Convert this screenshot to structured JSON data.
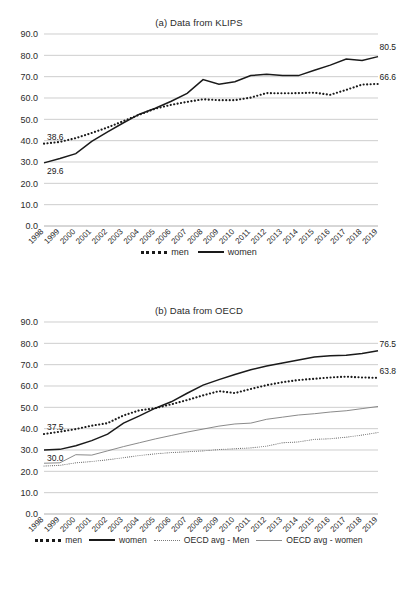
{
  "figure": {
    "top_fragment": "",
    "panels": [
      {
        "id": "a",
        "title": "(a) Data from KLIPS",
        "legend": [
          {
            "label": "men",
            "style": "dotted-bold"
          },
          {
            "label": "women",
            "style": "solid-bold"
          }
        ]
      },
      {
        "id": "b",
        "title": "(b) Data from OECD",
        "legend": [
          {
            "label": "men",
            "style": "dotted-bold"
          },
          {
            "label": "women",
            "style": "solid-bold"
          },
          {
            "label": "OECD avg - Men",
            "style": "dotted-thin"
          },
          {
            "label": "OECD avg - women",
            "style": "solid-thin"
          }
        ]
      }
    ]
  },
  "chart_data": [
    {
      "type": "line",
      "title": "(a) Data from KLIPS",
      "xlabel": "",
      "ylabel": "",
      "ylim": [
        0,
        90
      ],
      "yticks": [
        "0.0",
        "10.0",
        "20.0",
        "30.0",
        "40.0",
        "50.0",
        "60.0",
        "70.0",
        "80.0",
        "90.0"
      ],
      "grid": true,
      "legend_position": "bottom",
      "categories": [
        1998,
        1999,
        2000,
        2001,
        2002,
        2003,
        2004,
        2005,
        2006,
        2007,
        2008,
        2009,
        2010,
        2011,
        2012,
        2013,
        2014,
        2015,
        2016,
        2017,
        2018,
        2019
      ],
      "series": [
        {
          "name": "men",
          "values": [
            38.6,
            39.4,
            41.2,
            43.6,
            46.2,
            49.2,
            52.2,
            55.0,
            56.8,
            58.2,
            59.4,
            59.0,
            59.0,
            60.2,
            62.3,
            62.2,
            62.3,
            62.5,
            61.5,
            63.8,
            66.3,
            66.6
          ]
        },
        {
          "name": "women",
          "values": [
            29.6,
            31.6,
            33.9,
            39.7,
            44.1,
            48.4,
            52.4,
            55.2,
            58.5,
            62.2,
            68.6,
            66.5,
            67.6,
            70.5,
            71.1,
            70.6,
            70.5,
            73.0,
            75.4,
            78.3,
            77.6,
            79.4
          ]
        }
      ],
      "annotations": [
        {
          "text": "38.6",
          "series": "men",
          "at": 1998
        },
        {
          "text": "66.6",
          "series": "men",
          "at": 2019
        },
        {
          "text": "29.6",
          "series": "women",
          "at": 1998
        },
        {
          "text": "80.5",
          "series": "women",
          "at": 2019
        }
      ]
    },
    {
      "type": "line",
      "title": "(b) Data from OECD",
      "xlabel": "",
      "ylabel": "",
      "ylim": [
        0,
        90
      ],
      "yticks": [
        "0.0",
        "10.0",
        "20.0",
        "30.0",
        "40.0",
        "50.0",
        "60.0",
        "70.0",
        "80.0",
        "90.0"
      ],
      "grid": true,
      "legend_position": "bottom",
      "categories": [
        1998,
        1999,
        2000,
        2001,
        2002,
        2003,
        2004,
        2005,
        2006,
        2007,
        2008,
        2009,
        2010,
        2011,
        2012,
        2013,
        2014,
        2015,
        2016,
        2017,
        2018,
        2019
      ],
      "series": [
        {
          "name": "men",
          "values": [
            37.5,
            38.6,
            39.8,
            41.4,
            42.6,
            46.2,
            48.6,
            49.6,
            51.4,
            53.4,
            55.6,
            57.6,
            56.7,
            58.6,
            60.4,
            61.8,
            62.8,
            63.4,
            64.0,
            64.4,
            64.0,
            63.8
          ]
        },
        {
          "name": "women",
          "values": [
            30.0,
            30.3,
            32.0,
            34.4,
            37.4,
            42.6,
            46.0,
            49.6,
            52.6,
            56.6,
            60.4,
            63.0,
            65.4,
            67.6,
            69.4,
            70.8,
            72.2,
            73.6,
            74.2,
            74.4,
            75.2,
            76.5
          ]
        },
        {
          "name": "OECD avg - Men",
          "values": [
            22.5,
            22.8,
            24.0,
            24.6,
            25.4,
            26.4,
            27.4,
            28.2,
            28.8,
            29.2,
            29.6,
            30.2,
            30.6,
            31.0,
            31.8,
            33.4,
            33.8,
            35.0,
            35.3,
            36.0,
            37.0,
            38.2
          ]
        },
        {
          "name": "OECD avg - women",
          "values": [
            23.8,
            24.0,
            27.8,
            27.6,
            29.6,
            31.6,
            33.4,
            35.2,
            36.8,
            38.4,
            39.8,
            41.2,
            42.2,
            42.6,
            44.4,
            45.4,
            46.4,
            47.0,
            47.8,
            48.4,
            49.4,
            50.4
          ]
        }
      ],
      "annotations": [
        {
          "text": "37.5",
          "series": "men",
          "at": 1998
        },
        {
          "text": "63.8",
          "series": "men",
          "at": 2019
        },
        {
          "text": "30.0",
          "series": "women",
          "at": 1998
        },
        {
          "text": "76.5",
          "series": "women",
          "at": 2019
        }
      ]
    }
  ]
}
